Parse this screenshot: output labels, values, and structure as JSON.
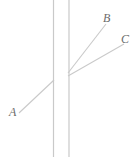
{
  "figure": {
    "type": "geometry-diagram",
    "width": 137,
    "height": 157,
    "background_color": "#ffffff",
    "line_color": "#c9c9c9",
    "label_color": "#6b6b6b",
    "labels": [
      {
        "id": "A",
        "text": "A",
        "x": 9,
        "y": 106
      },
      {
        "id": "B",
        "text": "B",
        "x": 103,
        "y": 12
      },
      {
        "id": "C",
        "text": "C",
        "x": 121,
        "y": 33
      }
    ],
    "strokes": [
      {
        "name": "vertical-line-left",
        "x1": 53.5,
        "y1": 0,
        "x2": 53.5,
        "y2": 157
      },
      {
        "name": "vertical-line-right",
        "x1": 69.0,
        "y1": 0,
        "x2": 69.0,
        "y2": 157
      },
      {
        "name": "transversal-from-A",
        "x1": 19,
        "y1": 113,
        "x2": 54,
        "y2": 80
      },
      {
        "name": "ray-to-B",
        "x1": 68,
        "y1": 73,
        "x2": 106,
        "y2": 24
      },
      {
        "name": "ray-to-C",
        "x1": 68,
        "y1": 76,
        "x2": 124,
        "y2": 44
      }
    ]
  }
}
